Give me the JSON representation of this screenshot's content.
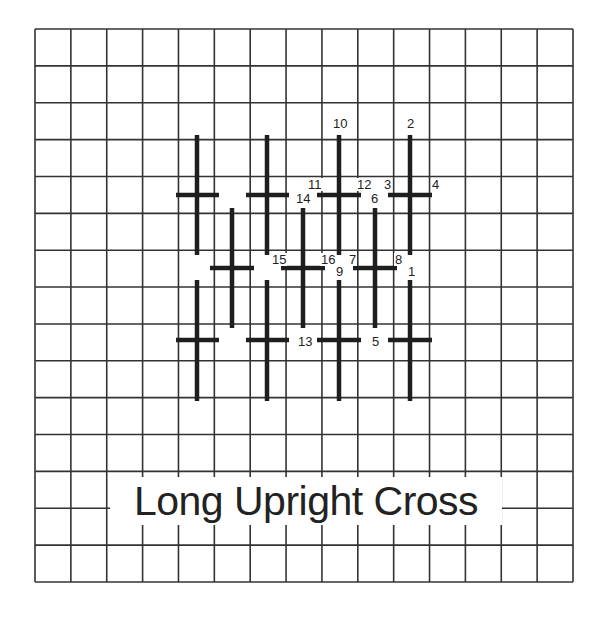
{
  "title": "Long Upright Cross",
  "grid": {
    "left": 35,
    "top": 29,
    "right": 573,
    "bottom": 582,
    "columns": 15,
    "rows": 15,
    "line_color": "#333333"
  },
  "stitch_color": "#1e1e1e",
  "stitches": [
    {
      "cx": 197,
      "cy": 195,
      "vTop": 135,
      "vBottom": 255,
      "hLeft": 176,
      "hRight": 219
    },
    {
      "cx": 267,
      "cy": 195,
      "vTop": 135,
      "vBottom": 255,
      "hLeft": 246,
      "hRight": 289
    },
    {
      "cx": 339,
      "cy": 195,
      "vTop": 135,
      "vBottom": 255,
      "hLeft": 317,
      "hRight": 361
    },
    {
      "cx": 410,
      "cy": 195,
      "vTop": 135,
      "vBottom": 255,
      "hLeft": 388,
      "hRight": 432
    },
    {
      "cx": 232,
      "cy": 268,
      "vTop": 208,
      "vBottom": 328,
      "hLeft": 210,
      "hRight": 254
    },
    {
      "cx": 303,
      "cy": 268,
      "vTop": 208,
      "vBottom": 328,
      "hLeft": 281,
      "hRight": 325
    },
    {
      "cx": 375,
      "cy": 268,
      "vTop": 208,
      "vBottom": 328,
      "hLeft": 353,
      "hRight": 397
    },
    {
      "cx": 197,
      "cy": 340,
      "vTop": 280,
      "vBottom": 401,
      "hLeft": 176,
      "hRight": 219
    },
    {
      "cx": 267,
      "cy": 340,
      "vTop": 280,
      "vBottom": 401,
      "hLeft": 246,
      "hRight": 289
    },
    {
      "cx": 339,
      "cy": 340,
      "vTop": 280,
      "vBottom": 401,
      "hLeft": 317,
      "hRight": 361
    },
    {
      "cx": 410,
      "cy": 340,
      "vTop": 280,
      "vBottom": 401,
      "hLeft": 388,
      "hRight": 432
    }
  ],
  "step_labels": [
    {
      "text": "10",
      "x": 332,
      "y": 117
    },
    {
      "text": "2",
      "x": 406,
      "y": 117
    },
    {
      "text": "11",
      "x": 307,
      "y": 178
    },
    {
      "text": "12",
      "x": 356,
      "y": 178
    },
    {
      "text": "3",
      "x": 383,
      "y": 178
    },
    {
      "text": "4",
      "x": 431,
      "y": 178
    },
    {
      "text": "14",
      "x": 295,
      "y": 192
    },
    {
      "text": "6",
      "x": 370,
      "y": 192
    },
    {
      "text": "15",
      "x": 271,
      "y": 253
    },
    {
      "text": "16",
      "x": 320,
      "y": 253
    },
    {
      "text": "7",
      "x": 348,
      "y": 253
    },
    {
      "text": "8",
      "x": 394,
      "y": 253
    },
    {
      "text": "9",
      "x": 335,
      "y": 265
    },
    {
      "text": "1",
      "x": 407,
      "y": 265
    },
    {
      "text": "13",
      "x": 297,
      "y": 335
    },
    {
      "text": "5",
      "x": 371,
      "y": 335
    }
  ]
}
